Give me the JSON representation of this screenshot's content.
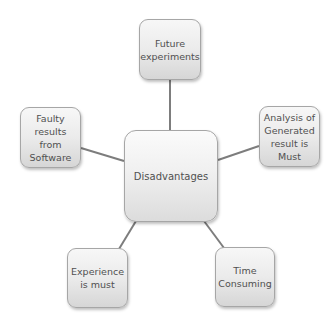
{
  "diagram": {
    "type": "radial-mind-map",
    "center": {
      "label": "Disadvantages"
    },
    "nodes": [
      {
        "id": "top",
        "label": "Future\nexperiments"
      },
      {
        "id": "right",
        "label": "Analysis of\nGenerated\nresult is\nMust"
      },
      {
        "id": "bottom-right",
        "label": "Time\nConsuming"
      },
      {
        "id": "bottom-left",
        "label": "Experience\nis must"
      },
      {
        "id": "left",
        "label": "Faulty\nresults\nfrom\nSoftware"
      }
    ],
    "edges": [
      {
        "from": "center",
        "to": "top"
      },
      {
        "from": "center",
        "to": "right"
      },
      {
        "from": "center",
        "to": "bottom-right"
      },
      {
        "from": "center",
        "to": "bottom-left"
      },
      {
        "from": "center",
        "to": "left"
      }
    ],
    "colors": {
      "connector": "#7d7d7d",
      "node_border": "#a6a6a6",
      "node_text": "#505050",
      "node_fill_top": "#f7f7f7",
      "node_fill_bottom": "#d6d6d6"
    }
  }
}
